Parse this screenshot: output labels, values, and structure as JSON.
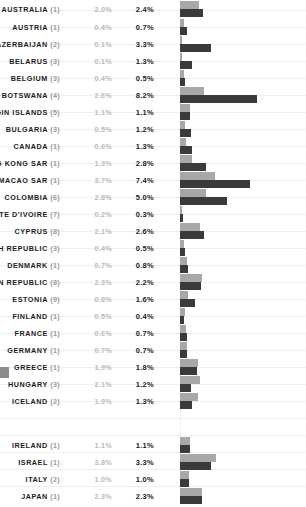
{
  "chart_data": {
    "type": "bar",
    "title": "",
    "subtitle": "",
    "xlabel": "",
    "ylabel": "",
    "orientation": "horizontal",
    "grid": true,
    "legend_position": "none",
    "xlim": [
      0,
      8.5
    ],
    "value_suffix": "%",
    "colors": {
      "series_a": "#a8a8a8",
      "series_b": "#3a3a3a",
      "gridline": "#efefef",
      "label_text": "#1c1c1c",
      "rank_text": "#9a9a9a",
      "value_a_text": "#b9b9b9",
      "background": "#ffffff"
    },
    "series": [
      {
        "name": "series_a",
        "color": "#a8a8a8"
      },
      {
        "name": "series_b",
        "color": "#3a3a3a"
      }
    ],
    "categories": [
      "AUSTRALIA",
      "AUSTRIA",
      "AZERBAIJAN",
      "BELARUS",
      "BELGIUM",
      "BOTSWANA",
      "BRITISH VIRGIN ISLANDS",
      "BULGARIA",
      "CANADA",
      "CHINA, HONG KONG SAR",
      "CHINA, MACAO SAR",
      "COLOMBIA",
      "COTE D'IVOIRE",
      "CYPRUS",
      "CZECH REPUBLIC",
      "DENMARK",
      "DOMINICAN REPUBLIC",
      "ESTONIA",
      "FINLAND",
      "FRANCE",
      "GERMANY",
      "GREECE",
      "HUNGARY",
      "ICELAND",
      "IRELAND",
      "ISRAEL",
      "ITALY",
      "JAPAN"
    ],
    "ranks": [
      1,
      1,
      2,
      3,
      3,
      4,
      5,
      3,
      1,
      1,
      1,
      6,
      7,
      8,
      3,
      1,
      8,
      9,
      1,
      1,
      1,
      1,
      3,
      2,
      1,
      1,
      2,
      1
    ],
    "values_a": [
      2.0,
      0.4,
      0.1,
      0.1,
      0.4,
      2.6,
      1.1,
      0.5,
      0.6,
      1.3,
      3.7,
      2.8,
      0.2,
      2.1,
      0.4,
      0.7,
      2.3,
      0.8,
      0.5,
      0.6,
      0.7,
      1.9,
      2.1,
      1.9,
      1.1,
      3.8,
      1.0,
      2.3
    ],
    "values_b": [
      2.4,
      0.7,
      3.3,
      1.3,
      0.5,
      8.2,
      1.1,
      1.2,
      1.3,
      2.8,
      7.4,
      5.0,
      0.3,
      2.6,
      0.5,
      0.8,
      2.2,
      1.6,
      0.4,
      0.7,
      0.7,
      1.8,
      1.2,
      1.3,
      1.1,
      3.3,
      1.0,
      2.3
    ]
  },
  "rows": [
    {
      "label": "AUSTRALIA",
      "rank": "(1)",
      "value_a": "2.0%",
      "value_b": "2.4%",
      "a": 2.0,
      "b": 2.4,
      "top": 14
    },
    {
      "label": "AUSTRIA",
      "rank": "(1)",
      "value_a": "0.4%",
      "value_b": "0.7%",
      "a": 0.4,
      "b": 0.7,
      "top": 32
    },
    {
      "label": "AZERBAIJAN",
      "rank": "(2)",
      "value_a": "0.1%",
      "value_b": "3.3%",
      "a": 0.1,
      "b": 3.3,
      "top": 49
    },
    {
      "label": "BELARUS",
      "rank": "(3)",
      "value_a": "0.1%",
      "value_b": "1.3%",
      "a": 0.1,
      "b": 1.3,
      "top": 66
    },
    {
      "label": "BELGIUM",
      "rank": "(3)",
      "value_a": "0.4%",
      "value_b": "0.5%",
      "a": 0.4,
      "b": 0.5,
      "top": 83
    },
    {
      "label": "BOTSWANA",
      "rank": "(4)",
      "value_a": "2.6%",
      "value_b": "8.2%",
      "a": 2.6,
      "b": 8.2,
      "top": 100
    },
    {
      "label": "BRITISH VIRGIN ISLANDS",
      "rank": "(5)",
      "value_a": "1.1%",
      "value_b": "1.1%",
      "a": 1.1,
      "b": 1.1,
      "top": 117
    },
    {
      "label": "BULGARIA",
      "rank": "(3)",
      "value_a": "0.5%",
      "value_b": "1.2%",
      "a": 0.5,
      "b": 1.2,
      "top": 134
    },
    {
      "label": "CANADA",
      "rank": "(1)",
      "value_a": "0.6%",
      "value_b": "1.3%",
      "a": 0.6,
      "b": 1.3,
      "top": 151
    },
    {
      "label": "CHINA, HONG KONG SAR",
      "rank": "(1)",
      "value_a": "1.3%",
      "value_b": "2.8%",
      "a": 1.3,
      "b": 2.8,
      "top": 168
    },
    {
      "label": "CHINA, MACAO SAR",
      "rank": "(1)",
      "value_a": "3.7%",
      "value_b": "7.4%",
      "a": 3.7,
      "b": 7.4,
      "top": 185
    },
    {
      "label": "COLOMBIA",
      "rank": "(6)",
      "value_a": "2.8%",
      "value_b": "5.0%",
      "a": 2.8,
      "b": 5.0,
      "top": 202
    },
    {
      "label": "COTE D'IVOIRE",
      "rank": "(7)",
      "value_a": "0.2%",
      "value_b": "0.3%",
      "a": 0.2,
      "b": 0.3,
      "top": 219
    },
    {
      "label": "CYPRUS",
      "rank": "(8)",
      "value_a": "2.1%",
      "value_b": "2.6%",
      "a": 2.1,
      "b": 2.6,
      "top": 236
    },
    {
      "label": "CZECH REPUBLIC",
      "rank": "(3)",
      "value_a": "0.4%",
      "value_b": "0.5%",
      "a": 0.4,
      "b": 0.5,
      "top": 253
    },
    {
      "label": "DENMARK",
      "rank": "(1)",
      "value_a": "0.7%",
      "value_b": "0.8%",
      "a": 0.7,
      "b": 0.8,
      "top": 270
    },
    {
      "label": "DOMINICAN REPUBLIC",
      "rank": "(8)",
      "value_a": "2.3%",
      "value_b": "2.2%",
      "a": 2.3,
      "b": 2.2,
      "top": 287
    },
    {
      "label": "ESTONIA",
      "rank": "(9)",
      "value_a": "0.8%",
      "value_b": "1.6%",
      "a": 0.8,
      "b": 1.6,
      "top": 304
    },
    {
      "label": "FINLAND",
      "rank": "(1)",
      "value_a": "0.5%",
      "value_b": "0.4%",
      "a": 0.5,
      "b": 0.4,
      "top": 321
    },
    {
      "label": "FRANCE",
      "rank": "(1)",
      "value_a": "0.6%",
      "value_b": "0.7%",
      "a": 0.6,
      "b": 0.7,
      "top": 338
    },
    {
      "label": "GERMANY",
      "rank": "(1)",
      "value_a": "0.7%",
      "value_b": "0.7%",
      "a": 0.7,
      "b": 0.7,
      "top": 355
    },
    {
      "label": "GREECE",
      "rank": "(1)",
      "value_a": "1.9%",
      "value_b": "1.8%",
      "a": 1.9,
      "b": 1.8,
      "top": 372
    },
    {
      "label": "HUNGARY",
      "rank": "(3)",
      "value_a": "2.1%",
      "value_b": "1.2%",
      "a": 2.1,
      "b": 1.2,
      "top": 389
    },
    {
      "label": "ICELAND",
      "rank": "(2)",
      "value_a": "1.9%",
      "value_b": "1.3%",
      "a": 1.9,
      "b": 1.3,
      "top": 406
    },
    {
      "label": "IRELAND",
      "rank": "(1)",
      "value_a": "1.1%",
      "value_b": "1.1%",
      "a": 1.1,
      "b": 1.1,
      "top": 450
    },
    {
      "label": "ISRAEL",
      "rank": "(1)",
      "value_a": "3.8%",
      "value_b": "3.3%",
      "a": 3.8,
      "b": 3.3,
      "top": 467
    },
    {
      "label": "ITALY",
      "rank": "(2)",
      "value_a": "1.0%",
      "value_b": "1.0%",
      "a": 1.0,
      "b": 1.0,
      "top": 484
    },
    {
      "label": "JAPAN",
      "rank": "(1)",
      "value_a": "2.3%",
      "value_b": "2.3%",
      "a": 2.3,
      "b": 2.3,
      "top": 501
    }
  ],
  "layout": {
    "bar_origin_x": 180,
    "px_per_percent": 9.4,
    "row_pitch": 17,
    "gridline_count": 29
  }
}
